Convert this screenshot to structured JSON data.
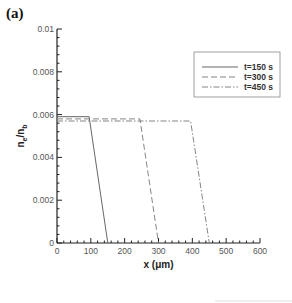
{
  "panel_label": "(a)",
  "chart_data": {
    "type": "line",
    "title": "",
    "xlabel": "x (μm)",
    "ylabel": "n_e/n_b",
    "xlim": [
      0,
      600
    ],
    "ylim": [
      0,
      0.01
    ],
    "xticks": [
      0,
      100,
      200,
      300,
      400,
      500,
      600
    ],
    "xtick_labels": [
      "0",
      "100",
      "200",
      "300",
      "400",
      "500",
      "600"
    ],
    "yticks": [
      0,
      0.002,
      0.004,
      0.006,
      0.008,
      0.01
    ],
    "ytick_labels": [
      "0",
      "0.002",
      "0.004",
      "0.006",
      "0.008",
      "0.01"
    ],
    "grid": false,
    "legend_position": "upper right",
    "series": [
      {
        "name": "t=150 s",
        "style": "solid",
        "x": [
          0,
          95,
          150
        ],
        "y": [
          0.0059,
          0.0059,
          0
        ]
      },
      {
        "name": "t=300 s",
        "style": "dashed",
        "x": [
          0,
          245,
          300
        ],
        "y": [
          0.0058,
          0.0058,
          0
        ]
      },
      {
        "name": "t=450 s",
        "style": "dashdot",
        "x": [
          0,
          395,
          450
        ],
        "y": [
          0.0057,
          0.0057,
          0
        ]
      }
    ]
  }
}
